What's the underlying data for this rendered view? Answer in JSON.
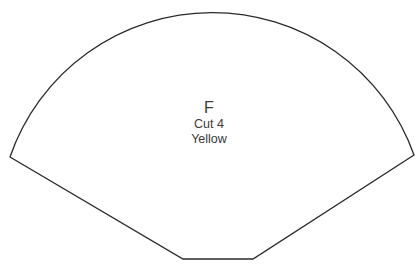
{
  "pattern_piece": {
    "letter": "F",
    "cut_instruction": "Cut 4",
    "fabric_color": "Yellow",
    "outline_color": "#2a2a2a"
  }
}
